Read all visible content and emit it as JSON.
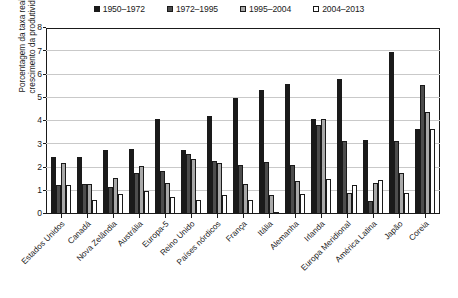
{
  "chart_data": {
    "type": "bar",
    "title": "",
    "xlabel": "",
    "ylabel": "Porcentagem da taxa real de\ncrescimento da produtividade",
    "ylim": [
      0,
      8
    ],
    "yticks": [
      0,
      1,
      2,
      3,
      4,
      5,
      6,
      7,
      8
    ],
    "grid": true,
    "legend_position": "top-center",
    "categories": [
      "Estados Unidos",
      "Canadá",
      "Nova Zelândia",
      "Austrália",
      "Europa-5",
      "Reino Unido",
      "Países nórdicos",
      "França",
      "Itália",
      "Alemanha",
      "Irlanda",
      "Europa Meridional",
      "América Latina",
      "Japão",
      "Coreia"
    ],
    "series": [
      {
        "name": "1950–1972",
        "color": "#1a1a1a",
        "values": [
          2.45,
          2.45,
          2.75,
          2.8,
          4.1,
          2.75,
          4.2,
          5.0,
          5.35,
          5.6,
          4.1,
          5.8,
          3.2,
          6.95,
          3.65
        ]
      },
      {
        "name": "1972–1995",
        "color": "#4d4d4d",
        "values": [
          1.25,
          1.3,
          1.15,
          1.75,
          1.85,
          2.6,
          2.3,
          2.1,
          2.25,
          2.1,
          3.85,
          3.15,
          0.55,
          3.15,
          5.55
        ]
      },
      {
        "name": "1995–2004",
        "color": "#a9a9a9",
        "values": [
          2.2,
          1.3,
          1.55,
          2.05,
          1.35,
          2.35,
          2.2,
          1.3,
          0.8,
          1.4,
          4.1,
          0.9,
          1.35,
          1.75,
          4.4
        ]
      },
      {
        "name": "2004–2013",
        "color": "#ffffff",
        "values": [
          1.25,
          0.6,
          0.85,
          1.0,
          0.75,
          0.6,
          0.8,
          0.6,
          0.05,
          0.85,
          1.5,
          1.25,
          1.45,
          0.9,
          3.65
        ]
      }
    ]
  }
}
